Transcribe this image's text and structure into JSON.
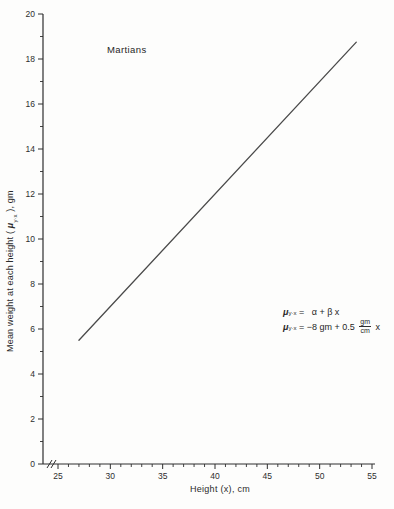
{
  "figure": {
    "background": "#fdfdfc",
    "ink_color": "#3a3a3a",
    "axis_color": "#2e2e2e",
    "line_color": "#4a4a4a"
  },
  "chart_data": {
    "type": "line",
    "title": "Martians",
    "xlabel": "Height (x), cm",
    "ylabel": "Mean weight at each height ( μ y·x ), gm",
    "xlim": [
      25,
      55
    ],
    "ylim": [
      0,
      20
    ],
    "x_major_ticks": [
      25,
      30,
      35,
      40,
      45,
      50,
      55
    ],
    "x_minor_step": 1,
    "y_major_ticks": [
      0,
      2,
      4,
      6,
      8,
      10,
      12,
      14,
      16,
      18,
      20
    ],
    "y_minor_step": 1,
    "grid": false,
    "legend": false,
    "axis_break_x": true,
    "series": [
      {
        "name": "population-regression-line",
        "x": [
          27,
          53.5
        ],
        "y": [
          5.5,
          18.75
        ]
      }
    ],
    "model": {
      "intercept_gm": -8,
      "slope_gm_per_cm": 0.5
    },
    "annotations": [
      "μy·x =  α + β x",
      "μy·x = −8 gm + 0.5 gm/cm x"
    ]
  },
  "ylabel_parts": {
    "pre": "Mean weight at each height ( ",
    "mu": "μ",
    "sub": "y·x",
    "post": " ), gm"
  },
  "equations": {
    "line1": {
      "mu": "μ",
      "sub": "y·x",
      "eq": " = ",
      "rhs": "α + β x"
    },
    "line2": {
      "mu": "μ",
      "sub": "y·x",
      "eq": " = ",
      "pre": "−8 gm + 0.5 ",
      "num": "gm",
      "den": "cm",
      "post": " x"
    }
  }
}
